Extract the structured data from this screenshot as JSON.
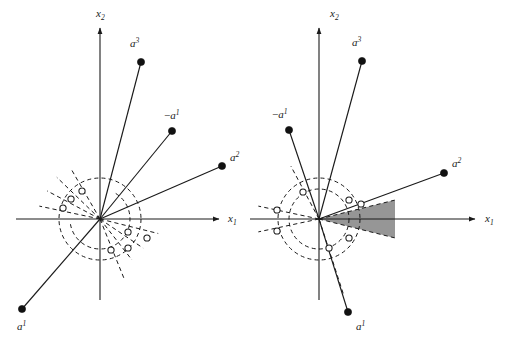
{
  "figure": {
    "background": "#ffffff",
    "ink": "#1a1a1a",
    "cone_fill": "#969696",
    "width": 514,
    "height": 346
  },
  "panels": [
    {
      "id": "left",
      "name": "left-panel",
      "origin": {
        "x": 100,
        "y": 219
      },
      "axes": {
        "x": {
          "label_base": "x",
          "label_sub": "1",
          "label_x": 228,
          "label_y": 222,
          "x1": 16,
          "y1": 219,
          "x2": 219,
          "y2": 219
        },
        "y": {
          "label_base": "x",
          "label_sub": "2",
          "label_x": 96,
          "label_y": 17,
          "x1": 100,
          "y1": 300,
          "x2": 100,
          "y2": 28
        }
      },
      "circles": [
        {
          "name": "outer-dashed-circle",
          "cx": 100,
          "cy": 219,
          "r": 41
        },
        {
          "name": "inner-dashed-arc",
          "cx": 100,
          "cy": 219,
          "r": 30,
          "arc": true,
          "a_start": -170,
          "a_end": 60
        }
      ],
      "vectors": [
        {
          "name": "vector-a3",
          "label_base": "a",
          "label_sup": "3",
          "neg": false,
          "tip": {
            "x": 141,
            "y": 62
          },
          "label_x": 130,
          "label_y": 47
        },
        {
          "name": "vector-neg-a1",
          "label_base": "a",
          "label_sup": "1",
          "neg": true,
          "tip": {
            "x": 172,
            "y": 131
          },
          "label_x": 164,
          "label_y": 119
        },
        {
          "name": "vector-a2",
          "label_base": "a",
          "label_sup": "2",
          "neg": false,
          "tip": {
            "x": 222,
            "y": 166
          },
          "label_x": 230,
          "label_y": 161
        },
        {
          "name": "vector-a1",
          "label_base": "a",
          "label_sup": "1",
          "neg": false,
          "tip": {
            "x": 22,
            "y": 309
          },
          "label_x": 17,
          "label_y": 330
        }
      ],
      "dashed_rays": [
        {
          "angle": 168,
          "len": 62
        },
        {
          "angle": 152,
          "len": 60
        },
        {
          "angle": 136,
          "len": 60
        },
        {
          "angle": 120,
          "len": 56
        },
        {
          "angle": -14,
          "len": 60
        },
        {
          "angle": -34,
          "len": 52
        },
        {
          "angle": -52,
          "len": 52
        },
        {
          "angle": -68,
          "len": 66
        }
      ],
      "hollow_points": [
        {
          "x": 82,
          "y": 191
        },
        {
          "x": 71,
          "y": 199
        },
        {
          "x": 63,
          "y": 208
        },
        {
          "x": 128,
          "y": 232
        },
        {
          "x": 147,
          "y": 238
        },
        {
          "x": 128,
          "y": 248
        },
        {
          "x": 111,
          "y": 250
        }
      ]
    },
    {
      "id": "right",
      "name": "right-panel",
      "origin": {
        "x": 319,
        "y": 219
      },
      "axes": {
        "x": {
          "label_base": "x",
          "label_sub": "1",
          "label_x": 485,
          "label_y": 222,
          "x1": 250,
          "y1": 219,
          "x2": 475,
          "y2": 219
        },
        "y": {
          "label_base": "x",
          "label_sub": "2",
          "label_x": 330,
          "label_y": 17,
          "x1": 319,
          "y1": 300,
          "x2": 319,
          "y2": 28
        }
      },
      "circles": [
        {
          "name": "outer-dashed-circle",
          "cx": 319,
          "cy": 219,
          "r": 41
        },
        {
          "name": "inner-dashed-circle",
          "cx": 319,
          "cy": 219,
          "r": 30
        }
      ],
      "cone": {
        "name": "feasible-cone",
        "apex": {
          "x": 319,
          "y": 219
        },
        "upper_angle": -14,
        "lower_angle": 14,
        "cut_x": 395
      },
      "vectors": [
        {
          "name": "vector-a3",
          "label_base": "a",
          "label_sup": "3",
          "neg": false,
          "tip": {
            "x": 362,
            "y": 61
          },
          "label_x": 352,
          "label_y": 46
        },
        {
          "name": "vector-neg-a1",
          "label_base": "a",
          "label_sup": "1",
          "neg": true,
          "tip": {
            "x": 289,
            "y": 130
          },
          "label_x": 272,
          "label_y": 118
        },
        {
          "name": "vector-a2",
          "label_base": "a",
          "label_sup": "2",
          "neg": false,
          "tip": {
            "x": 444,
            "y": 173
          },
          "label_x": 452,
          "label_y": 167
        },
        {
          "name": "vector-a1",
          "label_base": "a",
          "label_sup": "1",
          "neg": false,
          "tip": {
            "x": 348,
            "y": 312
          },
          "label_x": 356,
          "label_y": 330
        }
      ],
      "dashed_rays": [
        {
          "angle": 168,
          "len": 62
        },
        {
          "angle": -168,
          "len": 62
        },
        {
          "angle": -14,
          "len": 78
        },
        {
          "angle": 14,
          "len": 78
        },
        {
          "angle": 118,
          "len": 60
        },
        {
          "angle": -72,
          "len": 80
        }
      ],
      "hollow_points": [
        {
          "x": 303,
          "y": 192
        },
        {
          "x": 277,
          "y": 210
        },
        {
          "x": 277,
          "y": 231
        },
        {
          "x": 349,
          "y": 200
        },
        {
          "x": 361,
          "y": 204
        },
        {
          "x": 349,
          "y": 238
        },
        {
          "x": 329,
          "y": 248
        }
      ]
    }
  ]
}
